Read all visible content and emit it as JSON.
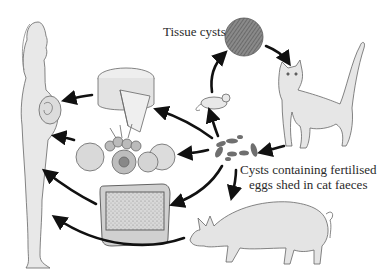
{
  "diagram": {
    "labels": {
      "tissue_cysts": "Tissue cysts",
      "cysts_line1": "Cysts containing fertilised",
      "cysts_line2": "eggs shed in cat faeces"
    },
    "nodes": [
      {
        "id": "tissue-cyst",
        "name": "Tissue cyst"
      },
      {
        "id": "cat",
        "name": "Cat"
      },
      {
        "id": "faecal-cysts",
        "name": "Cysts in cat faeces"
      },
      {
        "id": "mouse",
        "name": "Mouse"
      },
      {
        "id": "cheese",
        "name": "Cheese"
      },
      {
        "id": "fruit",
        "name": "Fruit and vegetables"
      },
      {
        "id": "litter-tray",
        "name": "Cat litter tray"
      },
      {
        "id": "pig",
        "name": "Pig"
      },
      {
        "id": "pregnant-woman",
        "name": "Pregnant woman"
      }
    ],
    "edges": [
      {
        "from": "tissue-cyst",
        "to": "cat"
      },
      {
        "from": "cat",
        "to": "faecal-cysts"
      },
      {
        "from": "faecal-cysts",
        "to": "mouse"
      },
      {
        "from": "mouse",
        "to": "tissue-cyst"
      },
      {
        "from": "faecal-cysts",
        "to": "cheese"
      },
      {
        "from": "faecal-cysts",
        "to": "fruit"
      },
      {
        "from": "faecal-cysts",
        "to": "litter-tray"
      },
      {
        "from": "faecal-cysts",
        "to": "pig"
      },
      {
        "from": "cheese",
        "to": "pregnant-woman"
      },
      {
        "from": "fruit",
        "to": "pregnant-woman"
      },
      {
        "from": "litter-tray",
        "to": "pregnant-woman"
      },
      {
        "from": "pig",
        "to": "pregnant-woman"
      }
    ],
    "colors": {
      "arrow": "#111111",
      "outline": "#555555",
      "fill": "#e6e6e6",
      "cyst": "#6a6a6a"
    }
  }
}
